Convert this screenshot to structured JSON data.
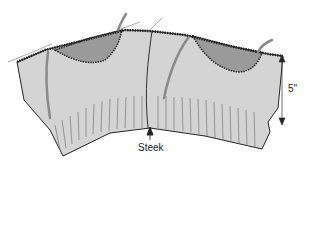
{
  "diagram": {
    "labels": {
      "steek": "Steek",
      "depth": "5\""
    },
    "colors": {
      "fabric": "#d4d4d4",
      "armhole_shade": "#9a9a9a",
      "yarn": "#8a8a8a",
      "outline": "#222222",
      "ribbing": "#666666"
    }
  }
}
